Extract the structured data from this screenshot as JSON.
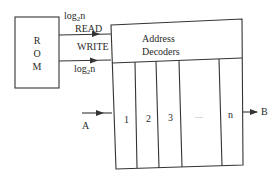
{
  "diagram": {
    "rom_block": {
      "letters": [
        "R",
        "O",
        "M"
      ]
    },
    "signals": {
      "top_bus": {
        "prefix": "log",
        "sub": "2",
        "suffix": "n"
      },
      "read": "READ",
      "write": "WRITE",
      "bottom_bus": {
        "prefix": "log",
        "sub": "2",
        "suffix": "n"
      }
    },
    "memory_block": {
      "header": [
        "Address",
        "Decoders"
      ],
      "columns": [
        "1",
        "2",
        "3",
        "....",
        "n"
      ]
    },
    "input_label": "A",
    "output_label": "B",
    "colors": {
      "line": "#333333",
      "background": "#ffffff"
    }
  }
}
